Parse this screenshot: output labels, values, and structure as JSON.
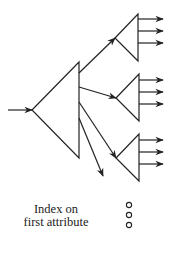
{
  "diagram": {
    "type": "index-tree",
    "root": {
      "shape": "triangle",
      "apex": [
        32,
        110
      ],
      "top": [
        79,
        62
      ],
      "bottom": [
        79,
        158
      ],
      "input_arrow": {
        "from": [
          8,
          110
        ],
        "to": [
          32,
          110
        ]
      }
    },
    "root_arrows": [
      {
        "from": [
          79,
          73
        ],
        "to": [
          115,
          38
        ]
      },
      {
        "from": [
          79,
          87
        ],
        "to": [
          116,
          98
        ]
      },
      {
        "from": [
          79,
          102
        ],
        "to": [
          116,
          158
        ]
      },
      {
        "from": [
          79,
          118
        ],
        "to": [
          103,
          176
        ]
      }
    ],
    "children": [
      {
        "apex": [
          115,
          38
        ],
        "top": [
          138,
          14
        ],
        "bottom": [
          138,
          61
        ],
        "outputs_y": [
          19,
          31,
          43
        ]
      },
      {
        "apex": [
          116,
          98
        ],
        "top": [
          139,
          74
        ],
        "bottom": [
          139,
          121
        ],
        "outputs_y": [
          80,
          92,
          104
        ]
      },
      {
        "apex": [
          116,
          158
        ],
        "top": [
          139,
          134
        ],
        "bottom": [
          139,
          181
        ],
        "outputs_y": [
          140,
          152,
          164
        ]
      }
    ],
    "output_arrow_end_x": 163,
    "ellipsis_dots": [
      {
        "cx": 129,
        "cy": 205
      },
      {
        "cx": 129,
        "cy": 215
      },
      {
        "cx": 129,
        "cy": 225
      }
    ],
    "caption_lines": [
      "Index on",
      "first attribute"
    ],
    "stroke_color": "#222222"
  }
}
